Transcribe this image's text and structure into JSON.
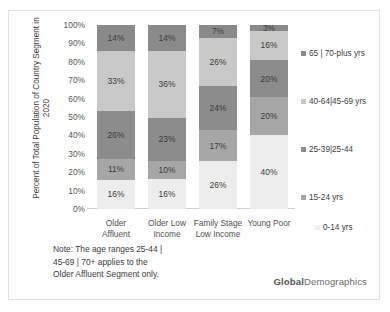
{
  "chart_data": {
    "type": "bar",
    "stacked": true,
    "stack_mode": "percent",
    "title": "",
    "subtitle": "",
    "xlabel": "",
    "ylabel": "Percent of Total Population of Country Segment in 2020",
    "ylabel_lines": [
      "Percent of Total Population of Country Segment in",
      "2020"
    ],
    "ylim": [
      0,
      100
    ],
    "yticks": [
      0,
      10,
      20,
      30,
      40,
      50,
      60,
      70,
      80,
      90,
      100
    ],
    "ytick_labels": [
      "0%",
      "10%",
      "20%",
      "30%",
      "40%",
      "50%",
      "60%",
      "70%",
      "80%",
      "90%",
      "100%"
    ],
    "grid": false,
    "legend_position": "right",
    "categories": [
      "Older Affluent",
      "Older Low Income",
      "Family Stage Low Income",
      "Young Poor"
    ],
    "category_lines": [
      [
        "Older",
        "Affluent"
      ],
      [
        "Older Low",
        "Income"
      ],
      [
        "Family Stage",
        "Low Income"
      ],
      [
        "Young Poor",
        ""
      ]
    ],
    "series": [
      {
        "name": "0-14 yrs",
        "color": "#ededed",
        "values": [
          16,
          16,
          26,
          40
        ],
        "labels": [
          "16%",
          "16%",
          "26%",
          "40%"
        ]
      },
      {
        "name": "15-24 yrs",
        "color": "#a6a6a6",
        "values": [
          11,
          10,
          17,
          20
        ],
        "labels": [
          "11%",
          "10%",
          "17%",
          "20%"
        ]
      },
      {
        "name": "25-39 | 25-44",
        "color": "#8c8c8c",
        "values": [
          26,
          23,
          24,
          20
        ],
        "labels": [
          "26%",
          "23%",
          "24%",
          "20%"
        ]
      },
      {
        "name": "40-64 | 45-69 yrs",
        "color": "#c9c9c9",
        "values": [
          33,
          36,
          26,
          16
        ],
        "labels": [
          "33%",
          "36%",
          "26%",
          "16%"
        ]
      },
      {
        "name": "65 | 70-plus yrs",
        "color": "#8a8a8a",
        "values": [
          14,
          14,
          7,
          3
        ],
        "labels": [
          "14%",
          "14%",
          "7%",
          "3%"
        ]
      }
    ],
    "legend_entries": [
      {
        "label": "65 | 70-plus yrs",
        "color": "#8a8a8a"
      },
      {
        "label": "40-64|45-69 yrs",
        "color": "#c9c9c9"
      },
      {
        "label": "25-39|25-44",
        "color": "#8c8c8c"
      },
      {
        "label": "15-24 yrs",
        "color": "#a6a6a6"
      },
      {
        "label": "0-14 yrs",
        "color": "#f2f2f2"
      }
    ],
    "annotations": [
      "Note: The age ranges 25-44 | 45-69 | 70+ applies to the Older Affluent Segment only."
    ]
  },
  "note": {
    "line1": "Note: The age ranges 25-44 |",
    "line2": "45-69 | 70+ applies to the",
    "line3": "Older Affluent Segment only."
  },
  "brand": {
    "bold": "Global",
    "regular": "Demographics"
  }
}
